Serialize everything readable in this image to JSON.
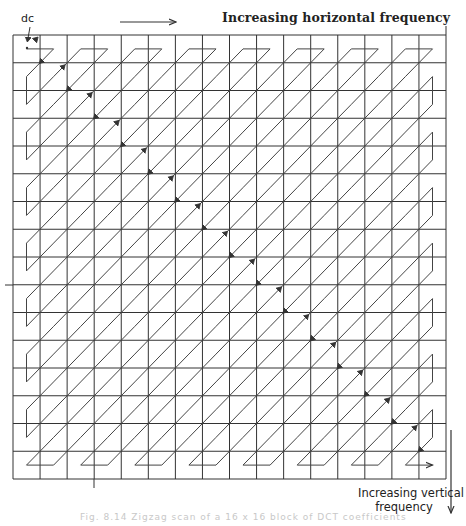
{
  "diagram": {
    "grid": {
      "rows": 16,
      "cols": 16,
      "x0": 13,
      "x1": 446,
      "y0": 35,
      "y1": 479,
      "line_color": "#333333"
    },
    "scan_path": {
      "type": "zigzag",
      "start": "dc",
      "line_color": "#444444",
      "end_arrow": true
    },
    "labels": {
      "dc": "dc",
      "horizontal_axis": "Increasing horizontal frequency",
      "vertical_axis_line1": "Increasing vertical",
      "vertical_axis_line2": "frequency",
      "caption": "Fig. 8.14 Zigzag scan of a 16 x 16 block of DCT coefficients"
    },
    "axis_arrows": {
      "horizontal": {
        "x1": 120,
        "x2": 176,
        "y": 22
      },
      "vertical": {
        "x": 451,
        "y1": 430,
        "y2": 513
      }
    }
  }
}
